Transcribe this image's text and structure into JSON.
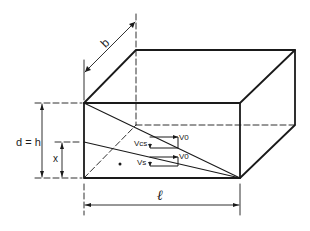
{
  "figure": {
    "type": "isometric block diagram",
    "colors": {
      "line": "#1a1a1a",
      "background": "#ffffff"
    }
  },
  "labels": {
    "width": "b",
    "depth": "d = h",
    "neutral_axis": "x",
    "length": "ℓ",
    "vcs": "Vcs",
    "vs": "Vs",
    "v0_top": "V0",
    "v0_bottom": "V0"
  }
}
